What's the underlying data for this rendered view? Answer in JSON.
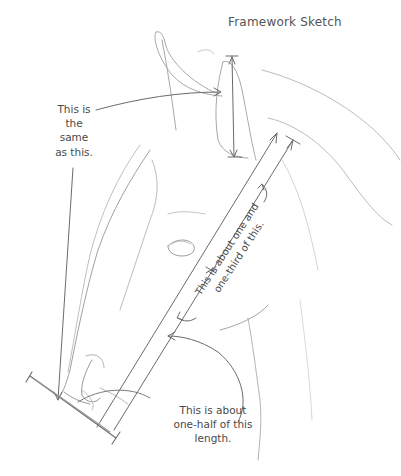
{
  "title": "Framework Sketch",
  "annotations": {
    "ear_note": {
      "lines": [
        "This is",
        "the",
        "same",
        "as this."
      ]
    },
    "diagonal_note": {
      "lines": [
        "This is about one and",
        "one-third of this."
      ]
    },
    "muzzle_note": {
      "lines": [
        "This is about",
        "one-half of this",
        "length."
      ]
    }
  },
  "colors": {
    "pencil": "#9a9a9a",
    "pencil_light": "#c8c8c8",
    "ink": "#5a5a5a",
    "text": "#4a4a4a",
    "background": "#ffffff"
  }
}
